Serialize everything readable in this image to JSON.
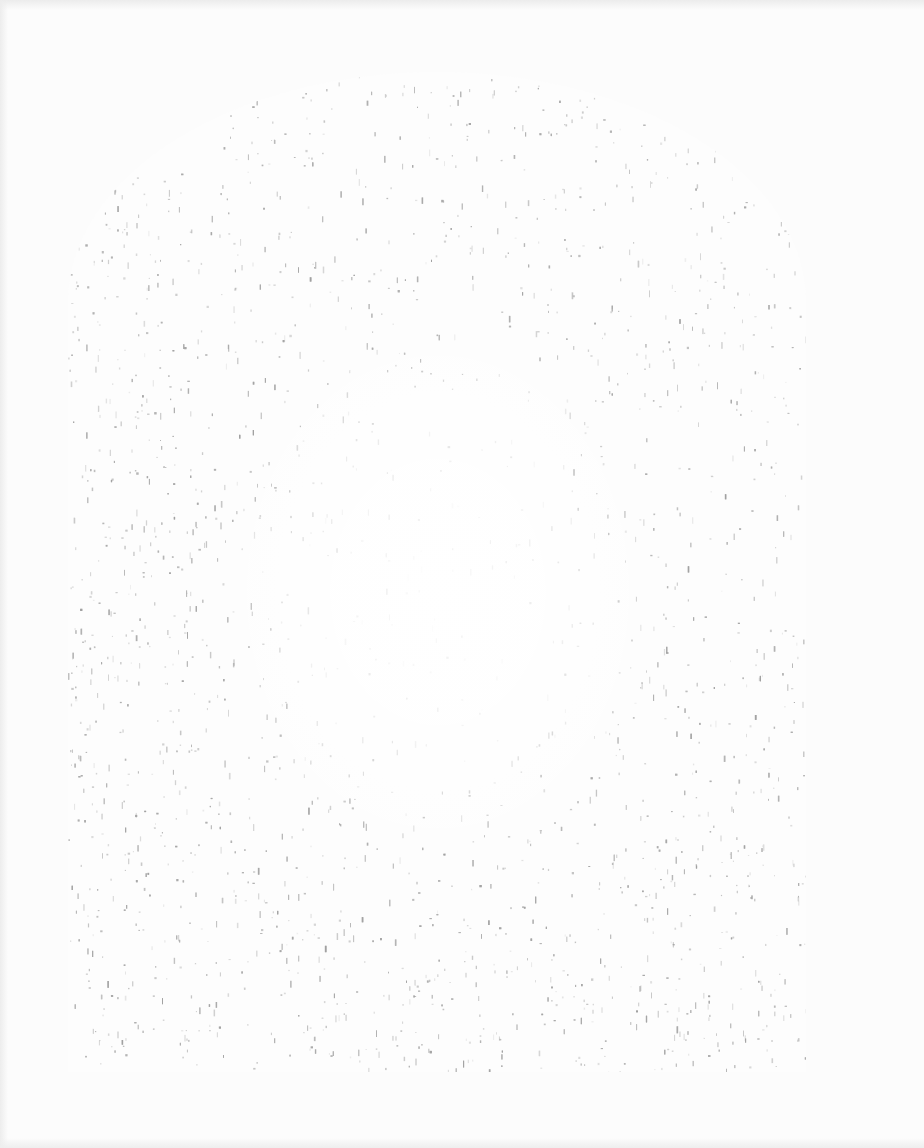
{
  "page": {
    "type": "scanned-page",
    "paper_color": "#fcfcfc",
    "speckle_color": "#9a9a9a",
    "edge_shadow_color": "#ececec"
  },
  "arch": {
    "shape": "round-top arch",
    "left": 68,
    "top": 72,
    "width": 738,
    "height": 1000
  },
  "text": []
}
